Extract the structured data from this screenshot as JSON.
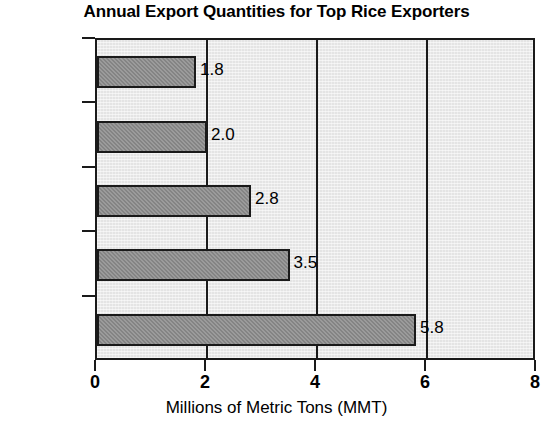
{
  "chart_data": {
    "type": "bar",
    "orientation": "horizontal",
    "title": "Annual Export Quantities for Top Rice Exporters",
    "xlabel": "Millions of Metric Tons (MMT)",
    "ylabel": "",
    "xlim": [
      0,
      8
    ],
    "xticks": [
      "0",
      "2",
      "4",
      "6",
      "8"
    ],
    "xtick_values": [
      0,
      2,
      4,
      6,
      8
    ],
    "grid": true,
    "legend": false,
    "categories": [
      "Pakistan",
      "India",
      "U.S.",
      "Vietnam",
      "Thailand"
    ],
    "values": [
      1.8,
      2.0,
      2.8,
      3.5,
      5.8
    ],
    "data_labels": [
      "1.8",
      "2.0",
      "2.8",
      "3.5",
      "5.8"
    ],
    "colors": {
      "bar_fill": "#8b8b8b",
      "bar_outline": "#1a1a1a",
      "plot_background": "#e4e4e4",
      "gridline": "#1a1a1a",
      "text": "#000000",
      "page_background": "#ffffff"
    }
  }
}
